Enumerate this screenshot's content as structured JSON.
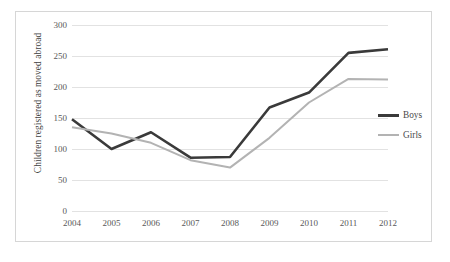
{
  "chart_data": {
    "type": "line",
    "title": "",
    "xlabel": "",
    "ylabel": "Children registered as moved abroad",
    "categories": [
      "2004",
      "2005",
      "2006",
      "2007",
      "2008",
      "2009",
      "2010",
      "2011",
      "2012"
    ],
    "x": [
      2004,
      2005,
      2006,
      2007,
      2008,
      2009,
      2010,
      2011,
      2012
    ],
    "series": [
      {
        "name": "Boys",
        "color": "#3a3a3a",
        "line_width": 2.6,
        "values": [
          148,
          100,
          127,
          86,
          87,
          167,
          191,
          255,
          261
        ]
      },
      {
        "name": "Girls",
        "color": "#b3b3b3",
        "line_width": 2.0,
        "values": [
          135,
          125,
          110,
          82,
          70,
          118,
          175,
          213,
          212
        ]
      }
    ],
    "ylim": [
      0,
      300
    ],
    "yticks": [
      0,
      50,
      100,
      150,
      200,
      250,
      300
    ],
    "ytick_labels": [
      "0",
      "50",
      "100",
      "150",
      "200",
      "250",
      "300"
    ],
    "xtick_labels": [
      "2004",
      "2005",
      "2006",
      "2007",
      "2008",
      "2009",
      "2010",
      "2011",
      "2012"
    ],
    "grid": "horizontal",
    "grid_color": "#e2e2e2",
    "legend_position": "right",
    "legend_entries": [
      "Boys",
      "Girls"
    ],
    "border_color": "#d6d6d6",
    "background": "#ffffff"
  }
}
